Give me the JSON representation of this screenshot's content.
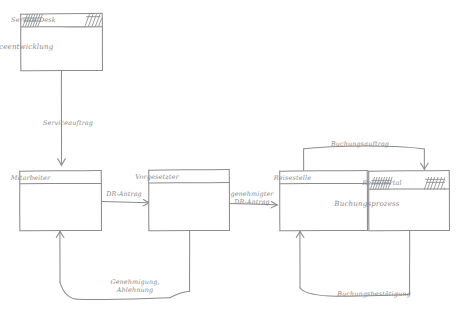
{
  "diagram": {
    "stroke_color": "#8c8c8c",
    "text_color": "#8a8a8a",
    "background_color": "#ffffff",
    "nodes": [
      {
        "id": "service-desk",
        "title": "Service Desk",
        "body": "Serviceentwicklung",
        "header_style": "hatched"
      },
      {
        "id": "mitarbeiter",
        "title": "Mitarbeiter",
        "body": "",
        "header_style": "plain"
      },
      {
        "id": "vorgesetzter",
        "title": "Vorgesetzter",
        "body": "",
        "header_style": "plain"
      },
      {
        "id": "reisestelle",
        "title": "Reisestelle",
        "body": "",
        "header_style": "plain"
      },
      {
        "id": "reiseportal",
        "title": "Reiseportal",
        "body": "Buchungsprozess",
        "header_style": "hatched"
      }
    ],
    "edges": [
      {
        "id": "serviceauftrag",
        "label": "Serviceauftrag",
        "from": "service-desk",
        "to": "mitarbeiter"
      },
      {
        "id": "dr-antrag",
        "label": "DR-Antrag",
        "from": "mitarbeiter",
        "to": "vorgesetzter"
      },
      {
        "id": "genehmigter-dr-antrag",
        "label_line1": "genehmigter",
        "label_line2": "DR-Antrag",
        "from": "vorgesetzter",
        "to": "reisestelle"
      },
      {
        "id": "genehmigung-ablehnung",
        "label_line1": "Genehmigung,",
        "label_line2": "Ablehnung",
        "from": "vorgesetzter",
        "to": "mitarbeiter"
      },
      {
        "id": "buchungsauftrag",
        "label": "Buchungsauftrag",
        "from": "reisestelle",
        "to": "reiseportal"
      },
      {
        "id": "buchungsbestaetigung",
        "label": "Buchungsbestätigung",
        "from": "reiseportal",
        "to": "reisestelle"
      }
    ]
  }
}
